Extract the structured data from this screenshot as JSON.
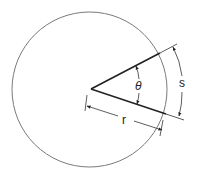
{
  "diagram": {
    "labels": {
      "angle": "θ",
      "arc_length": "s",
      "radius": "r"
    },
    "colors": {
      "circle": "#7a7a7a",
      "radii": "#222222",
      "dimension": "#333333",
      "text": "#222222"
    }
  }
}
